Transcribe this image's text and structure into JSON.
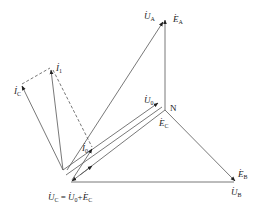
{
  "diagram": {
    "type": "phasor-diagram",
    "line_color": "#555555",
    "points": {
      "N": [
        165,
        110
      ],
      "A": [
        165,
        18
      ],
      "B": [
        236,
        182
      ],
      "C": [
        71,
        182
      ],
      "apex": [
        63,
        170
      ],
      "I1": [
        51,
        68
      ],
      "IC": [
        21,
        84
      ],
      "I0": [
        92,
        148
      ]
    },
    "labels": {
      "U_A": {
        "sym": "U",
        "sub": "A"
      },
      "E_A": {
        "sym": "E",
        "sub": "A"
      },
      "U_0": {
        "sym": "U",
        "sub": "0"
      },
      "N": "N",
      "E_C": {
        "sym": "E",
        "sub": "C"
      },
      "E_B": {
        "sym": "E",
        "sub": "B"
      },
      "U_B": {
        "sym": "U",
        "sub": "B"
      },
      "I_1": {
        "sym": "I",
        "sub": "1"
      },
      "I_C": {
        "sym": "I",
        "sub": "C"
      },
      "I_0": {
        "sym": "I",
        "sub": "0"
      },
      "equation": {
        "lhs": {
          "sym": "U",
          "sub": "C"
        },
        "eq": "=",
        "t1": {
          "sym": "U",
          "sub": "0"
        },
        "plus": "+",
        "t2": {
          "sym": "E",
          "sub": "C"
        }
      }
    }
  }
}
